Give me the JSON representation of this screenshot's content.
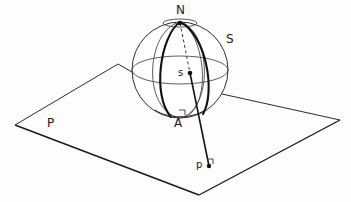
{
  "figure": {
    "background_color": "#fdfdfd",
    "ink_color": "#1a1a1a",
    "thin_color": "#555555",
    "width": 351,
    "height": 202
  },
  "labels": {
    "north_pole": "N",
    "sphere": "S",
    "center": "s",
    "tangent_point": "A",
    "plane": "P",
    "projected_point": "p",
    "angle_mark_a": "◡",
    "angle_mark_p": "◡"
  },
  "geometry": {
    "sphere": {
      "center_x": 180,
      "center_y": 70,
      "radius": 48,
      "equator_ry": 14,
      "arctic_circle_ry": 4
    },
    "plane": {
      "left_corner": [
        15,
        125
      ],
      "top_corner": [
        118,
        64
      ],
      "right_corner": [
        340,
        120
      ],
      "bottom_corner": [
        199,
        195
      ]
    },
    "points": {
      "N": [
        180,
        22
      ],
      "s": [
        190,
        74
      ],
      "A": [
        181,
        117
      ],
      "p": [
        209,
        166
      ]
    },
    "meridians": [
      {
        "name": "bold-front-meridian",
        "bold": true
      },
      {
        "name": "bold-right-meridian",
        "bold": true
      },
      {
        "name": "thin-left-meridian",
        "bold": false
      },
      {
        "name": "thin-right-meridian",
        "bold": false
      }
    ],
    "rays": [
      {
        "name": "dashed-axis-N-to-s",
        "style": "dashed",
        "from": "N",
        "to": "s"
      },
      {
        "name": "solid-ray-N-to-p",
        "style": "solid",
        "from": "s",
        "to": "p"
      }
    ]
  }
}
